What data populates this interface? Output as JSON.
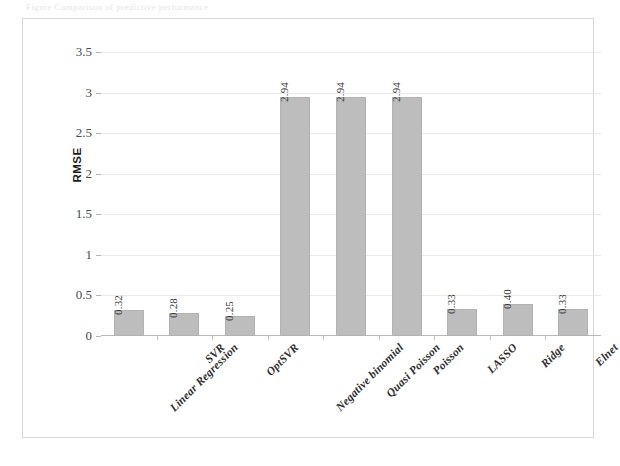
{
  "page": {
    "caption_remnant": "Figure  Comparison of predictive performance"
  },
  "chart_data": {
    "type": "bar",
    "title": "",
    "xlabel": "",
    "ylabel": "RMSE",
    "ylim": [
      0,
      3.5
    ],
    "ytick_labels": [
      "0",
      "0.5",
      "1",
      "1.5",
      "2",
      "2.5",
      "3",
      "3.5"
    ],
    "ytick_values": [
      0,
      0.5,
      1,
      1.5,
      2,
      2.5,
      3,
      3.5
    ],
    "grid": false,
    "legend": false,
    "categories": [
      "Linear Regression",
      "SVR",
      "OptSVR",
      "Negative binomial",
      "Quasi Poisson",
      "Poisson",
      "LASSO",
      "Ridge",
      "Elnet"
    ],
    "values": [
      0.32,
      0.28,
      0.25,
      2.94,
      2.94,
      2.94,
      0.33,
      0.4,
      0.33
    ],
    "data_labels": [
      "0.32",
      "0.28",
      "0.25",
      "2.94",
      "2.94",
      "2.94",
      "0.33",
      "0.40",
      "0.33"
    ],
    "bar_color": "#bdbdbd",
    "bar_border_color": "#b2b2b2",
    "axis_color": "#b9b9b9",
    "frame_color": "#d8d8d8",
    "text_color": "#2e2e2e"
  }
}
